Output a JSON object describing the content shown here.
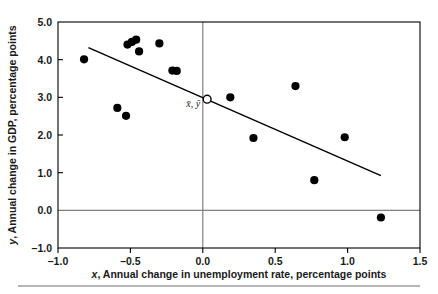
{
  "chart_data": {
    "type": "scatter",
    "title": "",
    "xlabel": "x, Annual change in unemployment rate, percentage points",
    "ylabel": "y, Annual change in GDP, percentage points",
    "xlim": [
      -1.0,
      1.5
    ],
    "ylim": [
      -1.0,
      5.0
    ],
    "xticks": [
      -1.0,
      -0.5,
      0.0,
      0.5,
      1.0,
      1.5
    ],
    "xtick_labels": [
      "–1.0",
      "–0.5",
      "0.0",
      "0.5",
      "1.0",
      "1.5"
    ],
    "yticks": [
      -1.0,
      0.0,
      1.0,
      2.0,
      3.0,
      4.0,
      5.0
    ],
    "ytick_labels": [
      "–1.0",
      "0.0",
      "1.0",
      "2.0",
      "3.0",
      "4.0",
      "5.0"
    ],
    "grid": false,
    "legend": null,
    "series": [
      {
        "name": "observations",
        "marker": "filled-circle",
        "color": "#000000",
        "points": [
          {
            "x": -0.82,
            "y": 4.01
          },
          {
            "x": -0.59,
            "y": 2.72
          },
          {
            "x": -0.53,
            "y": 2.51
          },
          {
            "x": -0.52,
            "y": 4.4
          },
          {
            "x": -0.49,
            "y": 4.47
          },
          {
            "x": -0.46,
            "y": 4.53
          },
          {
            "x": -0.44,
            "y": 4.22
          },
          {
            "x": -0.3,
            "y": 4.43
          },
          {
            "x": -0.21,
            "y": 3.71
          },
          {
            "x": -0.18,
            "y": 3.7
          },
          {
            "x": 0.19,
            "y": 3.0
          },
          {
            "x": 0.35,
            "y": 1.92
          },
          {
            "x": 0.64,
            "y": 3.3
          },
          {
            "x": 0.77,
            "y": 0.8
          },
          {
            "x": 0.98,
            "y": 1.94
          },
          {
            "x": 1.23,
            "y": -0.19
          }
        ]
      },
      {
        "name": "mean-point",
        "marker": "open-circle",
        "color": "#000000",
        "label": "x̄, ȳ",
        "points": [
          {
            "x": 0.03,
            "y": 2.95
          }
        ]
      }
    ],
    "regression_line": {
      "name": "line-of-best-fit",
      "color": "#000000",
      "x_start": -0.79,
      "y_start": 4.32,
      "x_end": 1.23,
      "y_end": 0.92
    },
    "reference_lines": [
      {
        "name": "zero-horizontal",
        "orientation": "horizontal",
        "value": 0.0,
        "color": "#808080"
      },
      {
        "name": "zero-vertical",
        "orientation": "vertical",
        "value": 0.0,
        "color": "#808080"
      }
    ],
    "axis_frame_color": "#000000",
    "footer_rule_color": "#6e6e6e"
  },
  "labels": {
    "x_axis_title_italic": "x",
    "x_axis_title_rest": ", Annual change in unemployment rate, percentage points",
    "y_axis_title_italic": "y",
    "y_axis_title_rest": ", Annual change in GDP, percentage points",
    "centroid": "x̄, ȳ"
  }
}
